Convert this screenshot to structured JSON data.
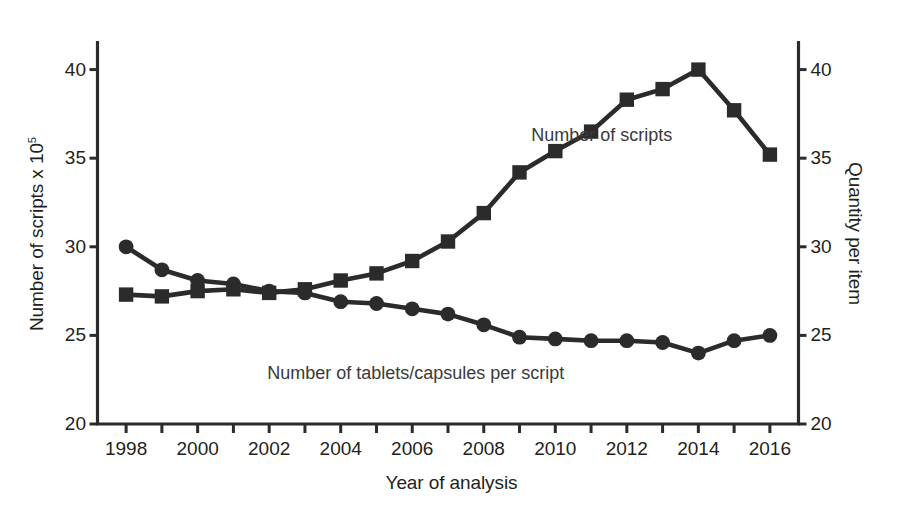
{
  "chart_data": {
    "type": "line",
    "title": "",
    "xlabel": "Year of analysis",
    "ylabel": "Number of scripts x 10⁵",
    "ylabel_right": "Quantity per item",
    "grid": false,
    "legend_position": "inline-annotation",
    "xlim": [
      1997.2,
      2016.8
    ],
    "ylim": [
      20,
      41.5
    ],
    "ylim_right": [
      20,
      41.5
    ],
    "yticks": [
      20,
      25,
      30,
      35,
      40
    ],
    "yticks_right": [
      20,
      25,
      30,
      35,
      40
    ],
    "xticks": [
      1998,
      1999,
      2000,
      2001,
      2002,
      2003,
      2004,
      2005,
      2006,
      2007,
      2008,
      2009,
      2010,
      2011,
      2012,
      2013,
      2014,
      2015,
      2016
    ],
    "xtick_labels_shown": [
      1998,
      2000,
      2002,
      2004,
      2006,
      2008,
      2010,
      2012,
      2014,
      2016
    ],
    "x": [
      1998,
      1999,
      2000,
      2001,
      2002,
      2003,
      2004,
      2005,
      2006,
      2007,
      2008,
      2009,
      2010,
      2011,
      2012,
      2013,
      2014,
      2015,
      2016
    ],
    "series": [
      {
        "name": "Number of scripts",
        "marker": "square",
        "axis": "left",
        "color": "#2b2b2b",
        "values": [
          27.3,
          27.2,
          27.5,
          27.6,
          27.4,
          27.6,
          28.1,
          28.5,
          29.2,
          30.3,
          31.9,
          34.2,
          35.4,
          36.5,
          38.3,
          38.9,
          40.0,
          37.7,
          35.2
        ]
      },
      {
        "name": "Number of tablets/capsules per script",
        "marker": "circle",
        "axis": "right",
        "color": "#2b2b2b",
        "values": [
          30.0,
          28.7,
          28.1,
          27.9,
          27.5,
          27.4,
          26.9,
          26.8,
          26.5,
          26.2,
          25.6,
          24.9,
          24.8,
          24.7,
          24.7,
          24.6,
          24.0,
          24.7,
          25.0
        ]
      }
    ],
    "annotations": [
      {
        "text": "Number of scripts",
        "x": 2011.3,
        "y": 36.3
      },
      {
        "text": "Number of tablets/capsules per script",
        "x": 2006.1,
        "y": 22.9
      }
    ]
  },
  "axes": {
    "left_title": "Number of scripts x 10",
    "left_title_exponent": "5",
    "right_title": "Quantity per item",
    "x_title": "Year of analysis"
  },
  "series_labels": {
    "scripts": "Number of scripts",
    "tablets": "Number of tablets/capsules per script"
  }
}
